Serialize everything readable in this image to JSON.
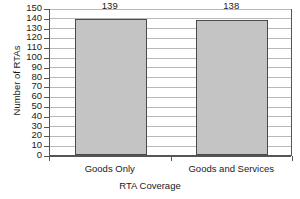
{
  "chart_data": {
    "type": "bar",
    "title": "",
    "subtitle": "",
    "categories": [
      "Goods Only",
      "Goods and Services"
    ],
    "values": [
      139,
      138
    ],
    "data_labels": [
      "139",
      "138"
    ],
    "xlabel": "RTA Coverage",
    "ylabel": "Number of RTAs",
    "ylim": [
      0,
      150
    ],
    "ytick_step": 10,
    "yticks": [
      150,
      140,
      130,
      120,
      110,
      100,
      90,
      80,
      70,
      60,
      50,
      40,
      30,
      20,
      10,
      0
    ],
    "ytick_labels": [
      "150",
      "140",
      "130",
      "120",
      "110",
      "100",
      "90",
      "80",
      "70",
      "60",
      "50",
      "40",
      "30",
      "20",
      "10",
      "0"
    ],
    "grid": true,
    "grid_orientation": "horizontal",
    "legend": false,
    "legend_position": "none",
    "bar_fill_color": "#c4c4c4",
    "bar_edge_color": "#4a4a4a",
    "gridline_color": "#b8b8b8",
    "axis_color": "#555555",
    "background_color": "#ffffff",
    "text_color": "#1a1a1a"
  }
}
